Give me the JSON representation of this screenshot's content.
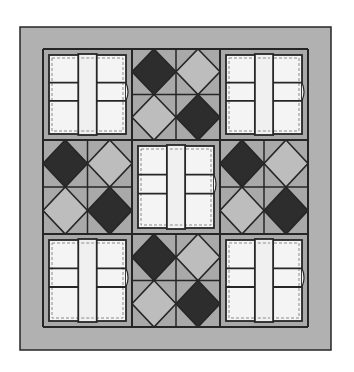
{
  "diagram": {
    "type": "quilt-pattern",
    "canvas": {
      "width": 354,
      "height": 372
    },
    "colors": {
      "page_bg": "#ffffff",
      "border_fill": "#b1b1b1",
      "line": "#262626",
      "cell_bg": "#a9a9a9",
      "dark_diamond": "#2d2d2d",
      "light_diamond": "#bdbdbd",
      "white_patch": "#f4f4f4",
      "strip_fill": "#f0f0f0",
      "dash": "#8a8a8a"
    },
    "outer_border": {
      "x": 20,
      "y": 27,
      "w": 311,
      "h": 323
    },
    "grid": {
      "cols": [
        43,
        132,
        220,
        308
      ],
      "rows": [
        49,
        140,
        234,
        327
      ]
    },
    "blocks": [
      {
        "row": 0,
        "col": 0,
        "kind": "cross"
      },
      {
        "row": 0,
        "col": 1,
        "kind": "diamonds",
        "pattern": [
          "dark",
          "light",
          "light",
          "dark"
        ]
      },
      {
        "row": 0,
        "col": 2,
        "kind": "cross"
      },
      {
        "row": 1,
        "col": 0,
        "kind": "diamonds",
        "pattern": [
          "dark",
          "light",
          "light",
          "dark"
        ]
      },
      {
        "row": 1,
        "col": 1,
        "kind": "cross"
      },
      {
        "row": 1,
        "col": 2,
        "kind": "diamonds",
        "pattern": [
          "dark",
          "light",
          "light",
          "dark"
        ]
      },
      {
        "row": 2,
        "col": 0,
        "kind": "cross"
      },
      {
        "row": 2,
        "col": 1,
        "kind": "diamonds",
        "pattern": [
          "dark",
          "light",
          "light",
          "dark"
        ]
      },
      {
        "row": 2,
        "col": 2,
        "kind": "cross"
      }
    ],
    "cross_block": {
      "inset": 6,
      "strip_fraction": [
        0.38,
        0.62
      ],
      "band_fraction": [
        0.35,
        0.58
      ]
    }
  }
}
